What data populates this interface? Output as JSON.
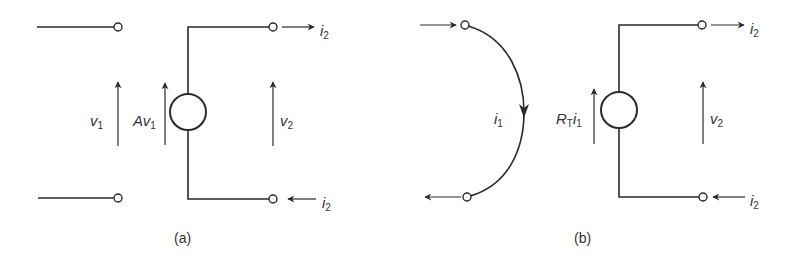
{
  "diagram_a": {
    "caption": "(a)",
    "input_voltage": {
      "sym": "v",
      "sub": "1"
    },
    "source_label": {
      "coef": "A",
      "sym": "v",
      "sub": "1"
    },
    "output_voltage": {
      "sym": "v",
      "sub": "2"
    },
    "output_current_top": {
      "sym": "i",
      "sub": "2"
    },
    "output_current_bottom": {
      "sym": "i",
      "sub": "2"
    }
  },
  "diagram_b": {
    "caption": "(b)",
    "input_current": {
      "sym": "i",
      "sub": "1"
    },
    "source_label": {
      "coef": "R",
      "coef_sub": "T",
      "sym": "i",
      "sub": "1"
    },
    "output_voltage": {
      "sym": "v",
      "sub": "2"
    },
    "output_current_top": {
      "sym": "i",
      "sub": "2"
    },
    "output_current_bottom": {
      "sym": "i",
      "sub": "2"
    }
  },
  "colors": {
    "stroke": "#2a2a2a",
    "text": "#333333",
    "background": "#ffffff"
  }
}
